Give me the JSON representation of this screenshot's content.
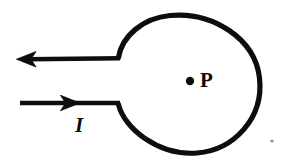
{
  "figure": {
    "kind": "physics-diagram",
    "background_color": "#ffffff",
    "ink_color": "#0d0d0d",
    "stroke_width_px": 5,
    "labels": {
      "point_label": "P",
      "current_label": "I"
    },
    "point_p": {
      "name": "P",
      "marker": "filled-dot",
      "cx": 190,
      "cy": 81,
      "r": 4.2
    },
    "loop": {
      "cx": 188,
      "cy": 85,
      "r": 72,
      "gap_start_deg": 183,
      "gap_end_deg": 177
    },
    "wires": [
      {
        "name": "upper-lead-wire",
        "current_direction": "leftward-out",
        "arrow": "left-arrowhead",
        "x_start": 17,
        "x_end": 120,
        "y": 59,
        "arrow_tip_x": 17,
        "arrow_base_x": 34
      },
      {
        "name": "lower-lead-wire",
        "current_direction": "rightward-in",
        "arrow": "right-arrowhead",
        "x_start": 20,
        "x_end": 120,
        "y": 103,
        "arrow_tip_x": 79,
        "arrow_base_x": 62
      }
    ],
    "speck": {
      "name": "scan-speck",
      "cx": 272,
      "cy": 141,
      "r": 1.6,
      "color": "#8a8a8a"
    }
  }
}
